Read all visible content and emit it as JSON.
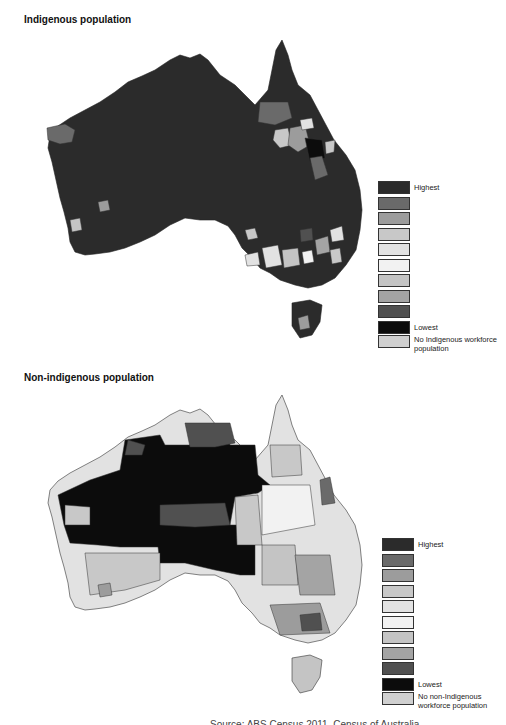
{
  "panels": [
    {
      "title": "Indigenous population",
      "legend": {
        "items": [
          {
            "label": "Highest",
            "color": "#2b2b2b"
          },
          {
            "label": "",
            "color": "#6a6a6a"
          },
          {
            "label": "",
            "color": "#9c9c9c"
          },
          {
            "label": "",
            "color": "#c8c8c8"
          },
          {
            "label": "",
            "color": "#e2e2e2"
          },
          {
            "label": "",
            "color": "#f2f2f2"
          },
          {
            "label": "",
            "color": "#c4c4c4"
          },
          {
            "label": "",
            "color": "#a4a4a4"
          },
          {
            "label": "",
            "color": "#505050"
          },
          {
            "label": "Lowest",
            "color": "#0c0c0c"
          },
          {
            "label": "No Indigenous workforce population",
            "color": "#d0d0d0"
          }
        ]
      }
    },
    {
      "title": "Non-indigenous population",
      "legend": {
        "items": [
          {
            "label": "Highest",
            "color": "#2b2b2b"
          },
          {
            "label": "",
            "color": "#6a6a6a"
          },
          {
            "label": "",
            "color": "#9c9c9c"
          },
          {
            "label": "",
            "color": "#c8c8c8"
          },
          {
            "label": "",
            "color": "#e2e2e2"
          },
          {
            "label": "",
            "color": "#f2f2f2"
          },
          {
            "label": "",
            "color": "#c4c4c4"
          },
          {
            "label": "",
            "color": "#a4a4a4"
          },
          {
            "label": "",
            "color": "#505050"
          },
          {
            "label": "Lowest",
            "color": "#0c0c0c"
          },
          {
            "label": "No non-Indigenous workforce population",
            "color": "#d0d0d0"
          }
        ]
      }
    }
  ],
  "footer": {
    "text": "Source: ABS Census 2011, Census of Australia"
  }
}
